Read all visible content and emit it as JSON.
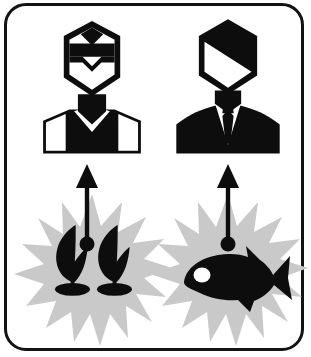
{
  "diagram": {
    "title": "Genetically modified organisms benefit pictogram",
    "frame": {
      "stroke_color": "#131313",
      "fill_color": "#ffffff",
      "corner_radius": 22,
      "stroke_width": 3
    },
    "palette": {
      "ink": "#0d0d0d",
      "starburst": "#c9c9c9",
      "paper": "#ffffff"
    },
    "panels": [
      {
        "id": "left",
        "source_label": "plant-seedlings",
        "source_description": "Two dark seedling sprouts on mound bases",
        "burst_label": "starburst",
        "arrow_label": "upward-arrow",
        "target_label": "worker-figure",
        "target_description": "Person bust with hexagonal head, dark visor band and V-neck vest"
      },
      {
        "id": "right",
        "source_label": "fish",
        "source_description": "Dark fish silhouette facing left with white eye",
        "burst_label": "starburst",
        "arrow_label": "upward-arrow",
        "target_label": "businessman-figure",
        "target_description": "Person bust with hexagonal head split diagonally, suit jacket, shirt and tie"
      }
    ],
    "icons": {
      "seedling": "seedling-icon",
      "fish": "fish-icon",
      "worker": "worker-bust-icon",
      "businessman": "businessman-bust-icon",
      "arrow_up": "arrow-up-icon",
      "burst": "starburst-icon"
    },
    "geometry": {
      "left_center_x": 92,
      "right_center_x": 228,
      "figure_top_y": 32,
      "figure_bottom_y": 160,
      "arrow_top_y": 168,
      "arrow_bottom_y": 243,
      "burst_center_y": 272
    }
  }
}
